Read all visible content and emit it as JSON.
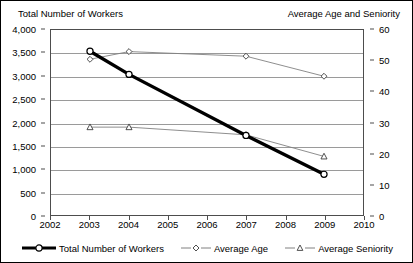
{
  "chart_data": {
    "type": "line",
    "title": "",
    "xlabel": "",
    "ylabel": "Total Number of Workers",
    "y2label": "Average Age and Seniority",
    "grid": true,
    "legend_position": "bottom",
    "x": [
      2003,
      2004,
      2007,
      2009
    ],
    "xlim": [
      2002,
      2010
    ],
    "xticks": [
      2002,
      2003,
      2004,
      2005,
      2006,
      2007,
      2008,
      2009,
      2010
    ],
    "xtick_labels": [
      "2002",
      "2003",
      "2004",
      "2005",
      "2006",
      "2007",
      "2008",
      "2009",
      "2010"
    ],
    "ylim": [
      0,
      4000
    ],
    "yticks": [
      0,
      500,
      1000,
      1500,
      2000,
      2500,
      3000,
      3500,
      4000
    ],
    "ytick_labels": [
      "0",
      "500",
      "1,000",
      "1,500",
      "2,000",
      "2,500",
      "3,000",
      "3,500",
      "4,000"
    ],
    "y2lim": [
      0,
      60
    ],
    "y2ticks": [
      0,
      10,
      20,
      30,
      40,
      50,
      60
    ],
    "y2tick_labels": [
      "0",
      "10",
      "20",
      "30",
      "40",
      "50",
      "60"
    ],
    "series": [
      {
        "name": "Total Number of Workers",
        "axis": "left",
        "marker": "circle",
        "line_width": 3.4,
        "color": "#000000",
        "values": [
          3540,
          3040,
          1720,
          880
        ]
      },
      {
        "name": "Average Age",
        "axis": "right",
        "marker": "diamond",
        "line_width": 0.9,
        "color": "#808080",
        "values": [
          50.5,
          53.0,
          51.5,
          45.0
        ]
      },
      {
        "name": "Average Seniority",
        "axis": "right",
        "marker": "triangle",
        "line_width": 0.9,
        "color": "#808080",
        "values": [
          28.5,
          28.5,
          26.0,
          19.0
        ]
      }
    ]
  },
  "legend": {
    "items": [
      {
        "label": "Total Number of Workers",
        "marker": "circle"
      },
      {
        "label": "Average Age",
        "marker": "diamond"
      },
      {
        "label": "Average Seniority",
        "marker": "triangle"
      }
    ]
  }
}
